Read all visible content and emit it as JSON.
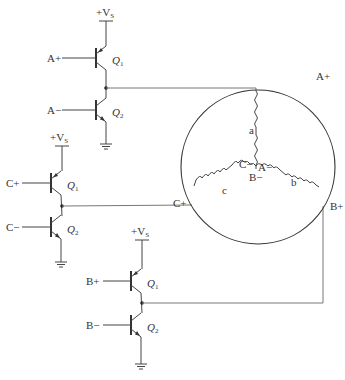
{
  "supply_label": "+V",
  "supply_sub": "S",
  "half_bridges": [
    {
      "phase": "A",
      "upper_input": "A+",
      "lower_input": "A−",
      "upper_q": "Q",
      "upper_sub": "1",
      "lower_q": "Q",
      "lower_sub": "2"
    },
    {
      "phase": "C",
      "upper_input": "C+",
      "lower_input": "C−",
      "upper_q": "Q",
      "upper_sub": "1",
      "lower_q": "Q",
      "lower_sub": "2"
    },
    {
      "phase": "B",
      "upper_input": "B+",
      "lower_input": "B−",
      "upper_q": "Q",
      "upper_sub": "1",
      "lower_q": "Q",
      "lower_sub": "2"
    }
  ],
  "motor": {
    "terminals": {
      "a_plus": "A+",
      "b_plus": "B+",
      "c_plus": "C+",
      "a_minus": "A−",
      "b_minus": "B−",
      "c_minus": "C−"
    },
    "windings": [
      "a",
      "b",
      "c"
    ]
  }
}
